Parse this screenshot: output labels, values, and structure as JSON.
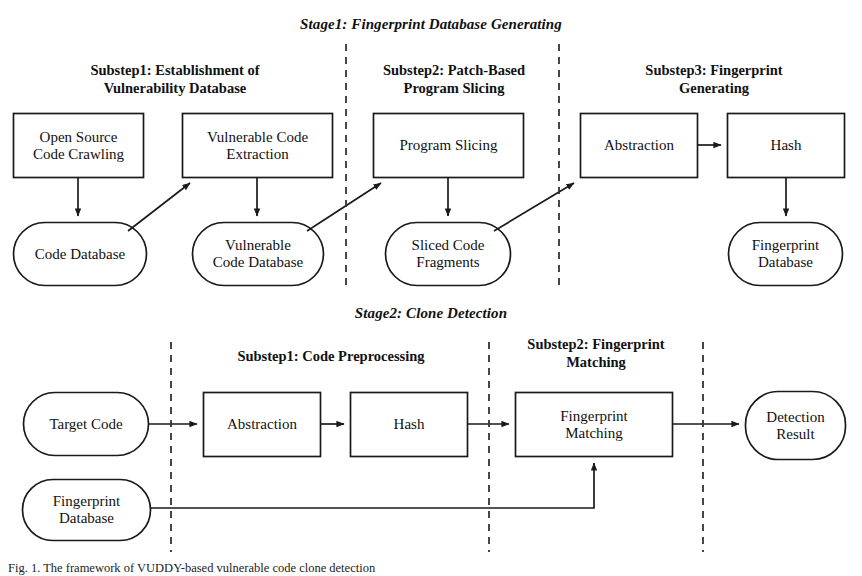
{
  "figure": {
    "stage1_title": "Stage1: Fingerprint Database Generating",
    "stage2_title": "Stage2: Clone Detection",
    "caption": "Fig. 1. The framework of VUDDY-based vulnerable code clone detection"
  },
  "stage1": {
    "substeps": [
      {
        "title": "Substep1: Establishment of\nVulnerability Database"
      },
      {
        "title": "Substep2: Patch-Based\nProgram Slicing"
      },
      {
        "title": "Substep3: Fingerprint\nGenerating"
      }
    ],
    "nodes": [
      {
        "id": "open-source-code-crawling",
        "label": "Open Source\nCode Crawling",
        "shape": "rect"
      },
      {
        "id": "vulnerable-code-extraction",
        "label": "Vulnerable Code\nExtraction",
        "shape": "rect"
      },
      {
        "id": "program-slicing",
        "label": "Program Slicing",
        "shape": "rect"
      },
      {
        "id": "abstraction",
        "label": "Abstraction",
        "shape": "rect"
      },
      {
        "id": "hash",
        "label": "Hash",
        "shape": "rect"
      },
      {
        "id": "code-database",
        "label": "Code Database",
        "shape": "stadium"
      },
      {
        "id": "vulnerable-code-database",
        "label": "Vulnerable\nCode Database",
        "shape": "stadium"
      },
      {
        "id": "sliced-code-fragments",
        "label": "Sliced Code\nFragments",
        "shape": "stadium"
      },
      {
        "id": "fingerprint-database",
        "label": "Fingerprint\nDatabase",
        "shape": "stadium"
      }
    ]
  },
  "stage2": {
    "substeps": [
      {
        "title": "Substep1: Code Preprocessing"
      },
      {
        "title": "Substep2: Fingerprint\nMatching"
      }
    ],
    "nodes": [
      {
        "id": "target-code",
        "label": "Target Code",
        "shape": "stadium"
      },
      {
        "id": "fingerprint-database-2",
        "label": "Fingerprint\nDatabase",
        "shape": "stadium"
      },
      {
        "id": "abstraction-2",
        "label": "Abstraction",
        "shape": "rect"
      },
      {
        "id": "hash-2",
        "label": "Hash",
        "shape": "rect"
      },
      {
        "id": "fingerprint-matching",
        "label": "Fingerprint\nMatching",
        "shape": "rect"
      },
      {
        "id": "detection-result",
        "label": "Detection\nResult",
        "shape": "stadium"
      }
    ]
  },
  "style": {
    "stroke": "#1a1a1a",
    "fill": "#ffffff",
    "divider": "#333333"
  }
}
